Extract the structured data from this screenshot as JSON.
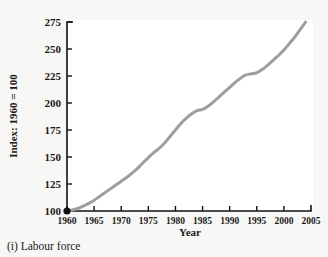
{
  "figure": {
    "caption": "(i) Labour force"
  },
  "chart_data": {
    "type": "line",
    "title": "",
    "subtitle": "",
    "xlabel": "Year",
    "ylabel": "Index: 1960 = 100",
    "xlim": [
      1960,
      2005
    ],
    "ylim": [
      100,
      275
    ],
    "grid": false,
    "legend": false,
    "legend_position": "none",
    "xticks": [
      1960,
      1965,
      1970,
      1975,
      1980,
      1985,
      1990,
      1995,
      2000,
      2005
    ],
    "yticks": [
      100,
      125,
      150,
      175,
      200,
      225,
      250,
      275
    ],
    "xtick_labels": [
      "1960",
      "1965",
      "1970",
      "1975",
      "1980",
      "1985",
      "1990",
      "1995",
      "2000",
      "2005"
    ],
    "ytick_labels": [
      "100",
      "125",
      "150",
      "175",
      "200",
      "225",
      "250",
      "275"
    ],
    "series": [
      {
        "name": "Labour force index",
        "color": "#9e9e9e",
        "line_width": 3,
        "marker_start": true,
        "marker_color": "#111111",
        "x": [
          1960,
          1961,
          1962,
          1963,
          1964,
          1965,
          1966,
          1967,
          1968,
          1969,
          1970,
          1971,
          1972,
          1973,
          1974,
          1975,
          1976,
          1977,
          1978,
          1979,
          1980,
          1981,
          1982,
          1983,
          1984,
          1985,
          1986,
          1987,
          1988,
          1989,
          1990,
          1991,
          1992,
          1993,
          1994,
          1995,
          1996,
          1997,
          1998,
          1999,
          2000,
          2001,
          2002,
          2003,
          2004
        ],
        "y": [
          100,
          101,
          102.5,
          104.5,
          107,
          110,
          113.5,
          117,
          120.5,
          124,
          127.5,
          131,
          135,
          139.5,
          144.5,
          149.5,
          154,
          158,
          163,
          169,
          175,
          181,
          186,
          190,
          193,
          194,
          197,
          201,
          205.5,
          210,
          214.5,
          219,
          223,
          226,
          227,
          228,
          231,
          235,
          239.5,
          244,
          249,
          255,
          261,
          268,
          275
        ]
      }
    ]
  },
  "axis_geometry": {
    "origin_x": 67,
    "origin_y": 211,
    "x_span_px": 244,
    "y_span_px": 189,
    "x_min": 1960,
    "x_max": 2005,
    "y_min": 100,
    "y_max": 275
  },
  "colors": {
    "background": "#f7f7f5",
    "plot_background": "#ffffff",
    "axis": "#111111",
    "line": "#9e9e9e",
    "text": "#1a1a1a"
  }
}
